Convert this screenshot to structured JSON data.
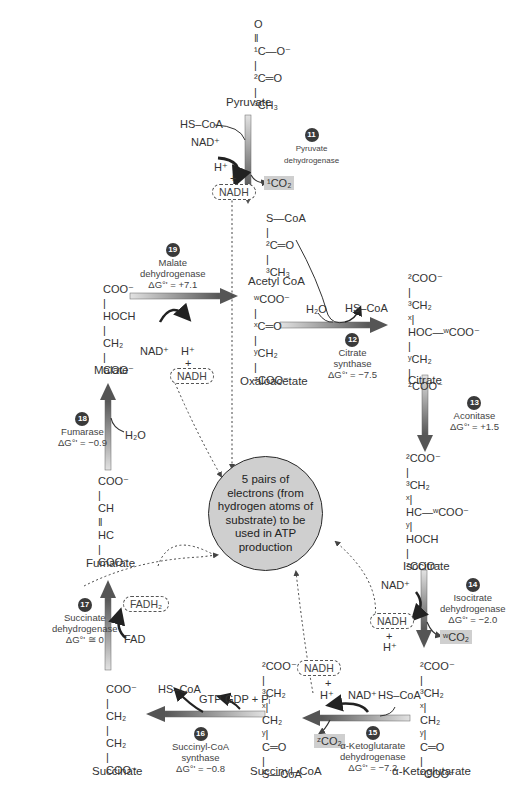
{
  "diagram": {
    "center_node": "5 pairs of electrons (from hydrogen atoms of substrate) to be used in ATP production",
    "colors": {
      "arrow_dark": "#555555",
      "arrow_light": "#d8d8d8",
      "center_fill": "#cfcfcf",
      "co2_highlight": "#cfcfcf",
      "badge": "#3a3a3a"
    },
    "molecules": {
      "pyruvate": {
        "name": "Pyruvate",
        "structure": "O\n‖\n¹C—O⁻\n|\n²C═O\n|\n³CH₃"
      },
      "acetyl_coa": {
        "name": "Acetyl CoA",
        "structure": "S—CoA\n|\n²C═O\n|\n³CH₃"
      },
      "oxaloacetate": {
        "name": "Oxaloacetate",
        "structure": "ʷCOO⁻\n|\nˣC═O\n|\nʸCH₂\n|\nᶻCOO⁻"
      },
      "citrate": {
        "name": "Citrate",
        "structure": "²COO⁻\n|\n³CH₂\nˣ|\nHOC—ʷCOO⁻\n|\nʸCH₂\n|\nᶻCOO⁻"
      },
      "isocitrate": {
        "name": "Isocitrate",
        "structure": "²COO⁻\n|\n³CH₂\nˣ|\nHC—ʷCOO⁻\nʸ|\nHOCH\n|\nᶻCOO⁻"
      },
      "alpha_ketoglutarate": {
        "name": "α-Ketoglutarate",
        "structure": "²COO⁻\n|\n³CH₂\nˣ|\nCH₂\nʸ|\nC═O\n|\nᶻCOO⁻"
      },
      "succinyl_coa": {
        "name": "Succinyl–CoA",
        "structure": "²COO⁻\n|\n³CH₂\nˣ|\nCH₂\nʸ|\nC═O\n|\nS—CoA"
      },
      "succinate": {
        "name": "Succinate",
        "structure": "COO⁻\n|\nCH₂\n|\nCH₂\n|\nCOO⁻"
      },
      "fumarate": {
        "name": "Fumarate",
        "structure": "COO⁻\n|\nCH\n‖\nHC\n|\nCOO⁻"
      },
      "malate": {
        "name": "Malate",
        "structure": "COO⁻\n|\nHOCH\n|\nCH₂\n|\nCOO⁻"
      }
    },
    "steps": [
      {
        "num": "11",
        "enzyme": "Pyruvate\ndehydrogenase",
        "dg": "",
        "inputs": [
          "HS–CoA",
          "NAD⁺"
        ],
        "outputs": [
          "H⁺ + NADH",
          "¹CO₂"
        ]
      },
      {
        "num": "12",
        "enzyme": "Citrate\nsynthase",
        "dg": "ΔG°' = −7.5",
        "inputs": [
          "H₂O"
        ],
        "outputs": [
          "HS–CoA"
        ]
      },
      {
        "num": "13",
        "enzyme": "Aconitase",
        "dg": "ΔG°' = +1.5"
      },
      {
        "num": "14",
        "enzyme": "Isocitrate\ndehydrogenase",
        "dg": "ΔG°' = −2.0",
        "inputs": [
          "NAD⁺"
        ],
        "outputs": [
          "NADH + H⁺",
          "ʷCO₂"
        ]
      },
      {
        "num": "15",
        "enzyme": "α-Ketoglutarate\ndehydrogenase",
        "dg": "ΔG°' = −7.2",
        "inputs": [
          "NAD⁺",
          "HS–CoA"
        ],
        "outputs": [
          "NADH + H⁺",
          "ᶻCO₂"
        ]
      },
      {
        "num": "16",
        "enzyme": "Succinyl-CoA\nsynthase",
        "dg": "ΔG°' = −0.8",
        "inputs": [
          "GDP + Pᵢ"
        ],
        "outputs": [
          "GTP",
          "HS–CoA"
        ]
      },
      {
        "num": "17",
        "enzyme": "Succinate\ndehydrogenase",
        "dg": "ΔG°' ≅ 0",
        "inputs": [
          "FAD"
        ],
        "outputs": [
          "FADH₂"
        ]
      },
      {
        "num": "18",
        "enzyme": "Fumarase",
        "dg": "ΔG°' = −0.9",
        "inputs": [
          "H₂O"
        ]
      },
      {
        "num": "19",
        "enzyme": "Malate\ndehydrogenase",
        "dg": "ΔG°' = +7.1",
        "inputs": [
          "NAD⁺"
        ],
        "outputs": [
          "H⁺ + NADH"
        ]
      }
    ],
    "labels": {
      "hs_coa": "HS–CoA",
      "nad": "NAD⁺",
      "h": "H⁺",
      "plus": "+",
      "nadh": "NADH",
      "fadh2": "FADH₂",
      "fad": "FAD",
      "h2o": "H₂O",
      "gtp": "GTP",
      "gdp_pi": "GDP + Pᵢ",
      "co2_1": "¹CO₂",
      "co2_w": "ʷCO₂",
      "co2_z": "ᶻCO₂"
    }
  }
}
